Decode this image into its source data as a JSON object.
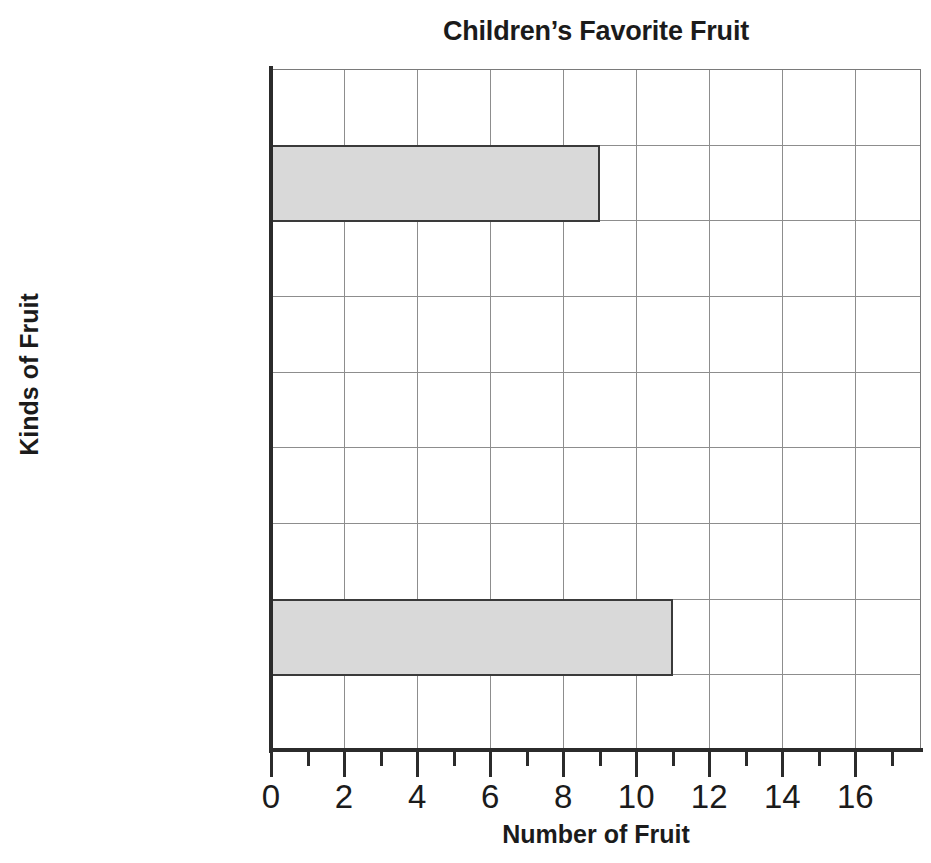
{
  "chart_data": {
    "type": "bar",
    "orientation": "horizontal",
    "title": "Children’s Favorite Fruit",
    "xlabel": "Number of Fruit",
    "ylabel": "Kinds of Fruit",
    "categories": [
      "Blueberry",
      "Orange",
      "Strawberry",
      "Watermelon"
    ],
    "values": [
      9,
      0,
      0,
      11
    ],
    "series": [
      {
        "name": "Number of Fruit",
        "values": [
          9,
          0,
          0,
          11
        ]
      }
    ],
    "xlim": [
      0,
      17.8
    ],
    "xticks": [
      0,
      2,
      4,
      6,
      8,
      10,
      12,
      14,
      16
    ],
    "xtick_labels": [
      "0",
      "2",
      "4",
      "6",
      "8",
      "10",
      "12",
      "14",
      "16"
    ],
    "minor_xticks": [
      1,
      3,
      5,
      7,
      9,
      11,
      13,
      15,
      17
    ],
    "grid": true,
    "grid_axis": "both",
    "legend": false,
    "bar_fill_color": "#d9d9d9",
    "bar_edge_color": "#3a3a3a",
    "grid_color": "#8d8d8d",
    "axis_color": "#2b2b2b",
    "text_color": "#1b1b1b",
    "background_color": "#ffffff"
  }
}
